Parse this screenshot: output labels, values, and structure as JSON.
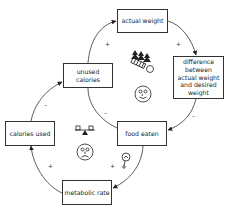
{
  "nodes": {
    "actual_weight": "actual weight",
    "difference": "difference between actual weight and desired weight",
    "unused_calories": "unused calories",
    "calories_used": "calories used",
    "food_eaten": "food eaten",
    "metabolic_rate": "metabolic rate"
  },
  "signs": {
    "unused_to_actual": "+",
    "actual_to_difference": "+",
    "food_to_unused": "–",
    "difference_to_food": "–",
    "calories_used_to_unused": "–",
    "metabolic_to_calories_used": "+",
    "food_to_metabolic": "+"
  },
  "icons": {
    "top_loop": [
      "trees-and-scale-icon",
      "happy-face-icon"
    ],
    "bottom_loop": [
      "seesaw-balance-icon",
      "sad-face-icon",
      "thermometer-gauge-icon"
    ]
  },
  "colors": {
    "line": "#333333",
    "text": "#222222",
    "background": "#ffffff"
  }
}
